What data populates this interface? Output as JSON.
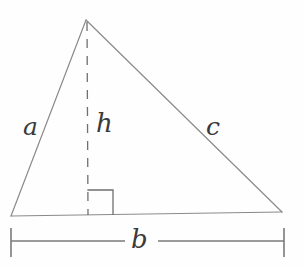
{
  "figure": {
    "type": "geometry-diagram",
    "background_color": "#fefefe",
    "stroke_color": "#8a8a8a",
    "label_color": "#3a3a3a",
    "labels": {
      "side_a": "a",
      "side_c": "c",
      "base_b": "b",
      "height_h": "h"
    },
    "geometry": {
      "apex": [
        86,
        20
      ],
      "left_vertex": [
        11,
        216
      ],
      "right_vertex": [
        282,
        212
      ],
      "foot_of_altitude": [
        88,
        215
      ],
      "altitude_style": "dashed",
      "right_angle_marker": {
        "corner": [
          88,
          214
        ],
        "horizontal_to": [
          113,
          190
        ],
        "size": 24
      },
      "dimension_line": {
        "y": 241,
        "left_tick_x": 11,
        "right_tick_x": 284,
        "tick_half_height": 14,
        "label_gap": [
          125,
          158
        ]
      }
    }
  }
}
